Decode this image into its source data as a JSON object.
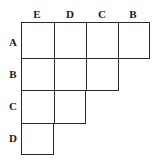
{
  "diagram": {
    "type": "triangular-matrix",
    "column_labels": [
      "E",
      "D",
      "C",
      "B"
    ],
    "row_labels": [
      "A",
      "B",
      "C",
      "D"
    ],
    "cells_per_row": [
      4,
      3,
      2,
      1
    ],
    "line_color": "#2a2a2a",
    "background": "#ffffff"
  }
}
